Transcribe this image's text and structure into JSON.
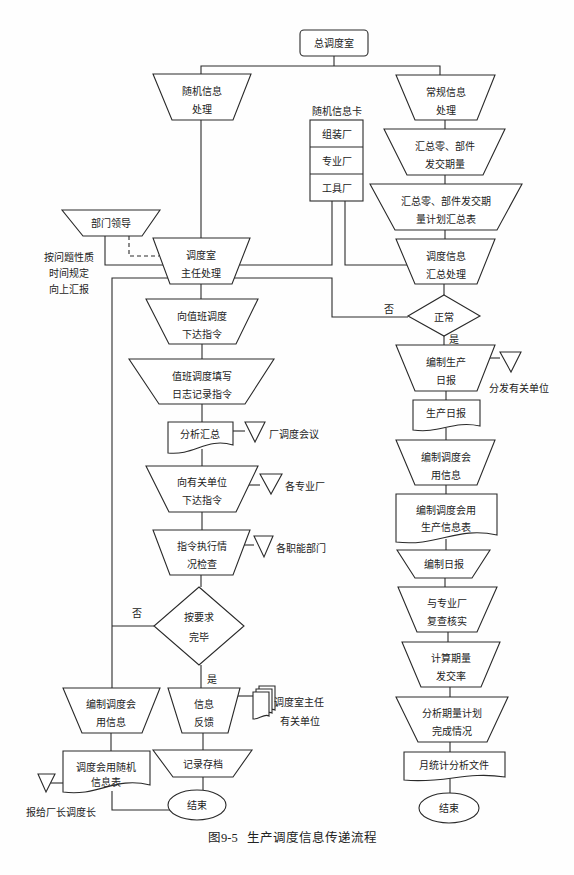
{
  "figure": {
    "caption_number": "图9-5",
    "caption_title": "生产调度信息传递流程"
  },
  "nodes": {
    "headquarters": {
      "label": "总调度室"
    },
    "random_info": {
      "lines": [
        "随机信息",
        "处理"
      ]
    },
    "regular_info": {
      "lines": [
        "常规信息",
        "处理"
      ]
    },
    "random_card": {
      "title": "随机信息卡",
      "rows": [
        "组装厂",
        "专业厂",
        "工具厂"
      ]
    },
    "summary_qty": {
      "lines": [
        "汇总零、部件",
        "发交期量"
      ]
    },
    "summary_table": {
      "lines": [
        "汇总零、部件发交期",
        "量计划汇总表"
      ]
    },
    "dispatch_summary": {
      "lines": [
        "调度信息",
        "汇总处理"
      ]
    },
    "dept_leader": {
      "label": "部门领导"
    },
    "report_note": {
      "lines": [
        "按问题性质",
        "时间规定",
        "向上汇报"
      ]
    },
    "director": {
      "lines": [
        "调度室",
        "主任处理"
      ]
    },
    "issue_to_duty": {
      "lines": [
        "向值班调度",
        "下达指令"
      ]
    },
    "duty_log": {
      "lines": [
        "值班调度填写",
        "日志记录指令"
      ]
    },
    "analysis": {
      "label": "分析汇总",
      "target": "厂调度会议"
    },
    "issue_to_units": {
      "lines": [
        "向有关单位",
        "下达指令"
      ],
      "target": "各专业厂"
    },
    "exec_check": {
      "lines": [
        "指令执行情",
        "况检查"
      ],
      "target": "各职能部门"
    },
    "complete_decision": {
      "lines": [
        "按要求",
        "完毕"
      ],
      "no": "否",
      "yes": "是"
    },
    "feedback": {
      "lines": [
        "信息",
        "反馈"
      ],
      "targets": [
        "调度室主任",
        "有关单位"
      ]
    },
    "archive": {
      "label": "记录存档"
    },
    "end_left": {
      "label": "结束"
    },
    "meeting_info_left": {
      "lines": [
        "编制调度会",
        "用信息"
      ]
    },
    "random_table": {
      "lines": [
        "调度会用随机",
        "信息表"
      ],
      "target": "报给厂长调度长"
    },
    "normal_decision": {
      "label": "正常",
      "no": "否",
      "yes": "是"
    },
    "daily_report_compile": {
      "lines": [
        "编制生产",
        "日报"
      ],
      "target": "分发有关单位"
    },
    "daily_report": {
      "label": "生产日报"
    },
    "meeting_info_right": {
      "lines": [
        "编制调度会",
        "用信息"
      ]
    },
    "production_table": {
      "lines": [
        "编制调度会用",
        "生产信息表"
      ]
    },
    "daily_compile": {
      "label": "编制日报"
    },
    "verify": {
      "lines": [
        "与专业厂",
        "复查核实"
      ]
    },
    "calc_rate": {
      "lines": [
        "计算期量",
        "发交率"
      ]
    },
    "analyze_plan": {
      "lines": [
        "分析期量计划",
        "完成情况"
      ]
    },
    "monthly_report": {
      "label": "月统计分析文件"
    },
    "end_right": {
      "label": "结束"
    }
  }
}
